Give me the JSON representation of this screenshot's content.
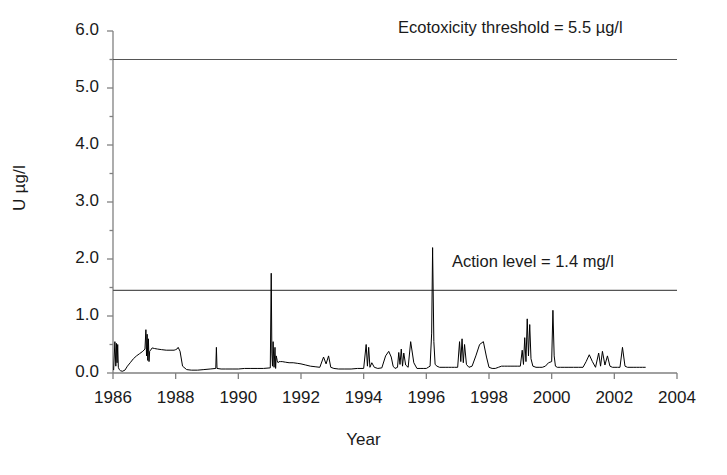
{
  "chart_data": {
    "type": "line",
    "title": "",
    "xlabel": "Year",
    "ylabel": "U µg/l",
    "xlim": [
      1986,
      2004
    ],
    "ylim": [
      0.0,
      6.0
    ],
    "grid": false,
    "legend": "none",
    "xticks": [
      "1986",
      "1988",
      "1990",
      "1992",
      "1994",
      "1996",
      "1998",
      "2000",
      "2002",
      "2004"
    ],
    "xtick_values": [
      1986,
      1988,
      1990,
      1992,
      1994,
      1996,
      1998,
      2000,
      2002,
      2004
    ],
    "yticks": [
      "0.0",
      "1.0",
      "2.0",
      "3.0",
      "4.0",
      "5.0",
      "6.0"
    ],
    "ytick_values": [
      0.0,
      1.0,
      2.0,
      3.0,
      4.0,
      5.0,
      6.0
    ],
    "yminor_step": 0.5,
    "line_color": "#000000",
    "axis_color": "#808080",
    "annotations": [
      {
        "name": "ecotoxicity-threshold",
        "text": "Ecotoxicity threshold = 5.5 µg/l",
        "value": 5.5
      },
      {
        "name": "action-level",
        "text": "Action level = 1.4 mg/l",
        "value": 1.45
      }
    ],
    "reference_lines": [
      {
        "name": "ecotoxicity-threshold-line",
        "y": 5.5
      },
      {
        "name": "action-level-line",
        "y": 1.45
      }
    ],
    "series": [
      {
        "name": "U concentration",
        "x": [
          1986.02,
          1986.06,
          1986.09,
          1986.11,
          1986.13,
          1986.15,
          1986.17,
          1986.2,
          1986.24,
          1986.3,
          1986.38,
          1986.46,
          1986.55,
          1986.65,
          1986.75,
          1986.85,
          1986.95,
          1987.02,
          1987.05,
          1987.07,
          1987.09,
          1987.11,
          1987.13,
          1987.15,
          1987.17,
          1987.2,
          1987.25,
          1987.32,
          1987.42,
          1987.55,
          1987.7,
          1987.85,
          1987.95,
          1988.0,
          1988.04,
          1988.08,
          1988.14,
          1988.22,
          1988.35,
          1988.5,
          1988.7,
          1988.9,
          1989.1,
          1989.28,
          1989.3,
          1989.32,
          1989.45,
          1989.6,
          1989.8,
          1990.0,
          1990.2,
          1990.4,
          1990.6,
          1990.8,
          1991.02,
          1991.05,
          1991.07,
          1991.09,
          1991.11,
          1991.14,
          1991.17,
          1991.19,
          1991.21,
          1991.24,
          1991.27,
          1991.3,
          1991.34,
          1991.4,
          1991.5,
          1991.62,
          1991.75,
          1991.88,
          1992.0,
          1992.15,
          1992.3,
          1992.45,
          1992.6,
          1992.72,
          1992.8,
          1992.88,
          1992.95,
          1993.05,
          1993.2,
          1993.4,
          1993.6,
          1993.8,
          1994.0,
          1994.08,
          1994.12,
          1994.16,
          1994.2,
          1994.26,
          1994.34,
          1994.45,
          1994.58,
          1994.7,
          1994.8,
          1994.88,
          1994.94,
          1995.0,
          1995.08,
          1995.12,
          1995.16,
          1995.2,
          1995.24,
          1995.28,
          1995.34,
          1995.42,
          1995.5,
          1995.6,
          1995.7,
          1995.8,
          1995.9,
          1996.0,
          1996.06,
          1996.12,
          1996.17,
          1996.2,
          1996.24,
          1996.28,
          1996.34,
          1996.42,
          1996.5,
          1996.6,
          1996.7,
          1996.8,
          1996.9,
          1997.0,
          1997.06,
          1997.1,
          1997.14,
          1997.18,
          1997.22,
          1997.28,
          1997.36,
          1997.46,
          1997.58,
          1997.7,
          1997.82,
          1997.92,
          1998.0,
          1998.1,
          1998.2,
          1998.3,
          1998.4,
          1998.5,
          1998.6,
          1998.7,
          1998.8,
          1998.9,
          1999.0,
          1999.06,
          1999.1,
          1999.14,
          1999.18,
          1999.22,
          1999.26,
          1999.3,
          1999.34,
          1999.4,
          1999.5,
          1999.6,
          1999.7,
          1999.8,
          1999.9,
          2000.0,
          2000.04,
          2000.08,
          2000.12,
          2000.18,
          2000.28,
          2000.4,
          2000.55,
          2000.7,
          2000.85,
          2001.0,
          2001.1,
          2001.2,
          2001.3,
          2001.4,
          2001.5,
          2001.56,
          2001.62,
          2001.7,
          2001.78,
          2001.86,
          2001.94,
          2002.02,
          2002.1,
          2002.18,
          2002.26,
          2002.34,
          2002.42,
          2002.5,
          2002.6,
          2002.7,
          2002.8,
          2002.9,
          2003.0
        ],
        "y": [
          0.05,
          0.55,
          0.12,
          0.52,
          0.18,
          0.5,
          0.1,
          0.06,
          0.04,
          0.03,
          0.05,
          0.12,
          0.18,
          0.25,
          0.3,
          0.34,
          0.38,
          0.42,
          0.76,
          0.3,
          0.68,
          0.22,
          0.6,
          0.2,
          0.38,
          0.4,
          0.44,
          0.43,
          0.42,
          0.41,
          0.4,
          0.4,
          0.4,
          0.41,
          0.42,
          0.45,
          0.38,
          0.12,
          0.06,
          0.05,
          0.05,
          0.06,
          0.07,
          0.08,
          0.45,
          0.08,
          0.07,
          0.07,
          0.07,
          0.07,
          0.08,
          0.08,
          0.08,
          0.08,
          0.09,
          1.75,
          0.35,
          0.12,
          0.55,
          0.1,
          0.45,
          0.08,
          0.3,
          0.22,
          0.18,
          0.2,
          0.2,
          0.2,
          0.19,
          0.18,
          0.18,
          0.17,
          0.16,
          0.14,
          0.12,
          0.11,
          0.1,
          0.28,
          0.16,
          0.3,
          0.1,
          0.08,
          0.07,
          0.07,
          0.07,
          0.08,
          0.08,
          0.5,
          0.12,
          0.45,
          0.1,
          0.18,
          0.1,
          0.08,
          0.09,
          0.3,
          0.38,
          0.28,
          0.12,
          0.08,
          0.1,
          0.36,
          0.15,
          0.42,
          0.12,
          0.35,
          0.14,
          0.1,
          0.55,
          0.18,
          0.08,
          0.08,
          0.08,
          0.08,
          0.1,
          0.12,
          0.7,
          2.2,
          0.55,
          0.15,
          0.12,
          0.1,
          0.1,
          0.1,
          0.1,
          0.1,
          0.1,
          0.1,
          0.55,
          0.2,
          0.6,
          0.18,
          0.5,
          0.15,
          0.1,
          0.12,
          0.3,
          0.5,
          0.55,
          0.28,
          0.1,
          0.08,
          0.08,
          0.1,
          0.12,
          0.12,
          0.12,
          0.12,
          0.12,
          0.12,
          0.12,
          0.4,
          0.15,
          0.62,
          0.2,
          0.95,
          0.3,
          0.85,
          0.25,
          0.12,
          0.1,
          0.1,
          0.1,
          0.12,
          0.18,
          0.2,
          1.1,
          0.3,
          0.12,
          0.1,
          0.1,
          0.1,
          0.1,
          0.1,
          0.1,
          0.1,
          0.2,
          0.32,
          0.2,
          0.1,
          0.35,
          0.12,
          0.38,
          0.14,
          0.3,
          0.12,
          0.1,
          0.1,
          0.1,
          0.1,
          0.45,
          0.12,
          0.1,
          0.1,
          0.1,
          0.1,
          0.1,
          0.1,
          0.1
        ]
      }
    ]
  }
}
